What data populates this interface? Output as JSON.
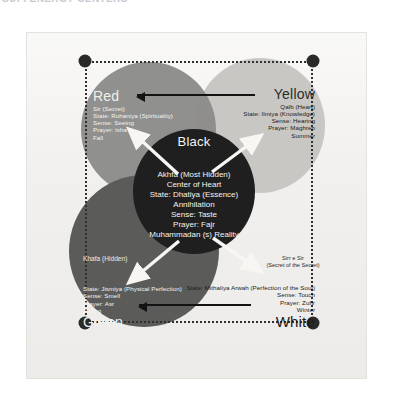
{
  "page": {
    "header_fragment": "SUFI ENERGY CENTERS",
    "background_color": "#ffffff",
    "scan_color": "#f2f1ef"
  },
  "diagram": {
    "type": "venn-overlapping-circles",
    "title_center": "Black",
    "colors": {
      "red_circle": "#8c8c8a",
      "yellow_circle": "#c8c7c3",
      "green_circle": "#5b5b5a",
      "black_circle": "#1f1f1f",
      "white_circle": "#f4f3f1",
      "arrow": "#131313",
      "dot": "#2a2a29"
    },
    "corner_dots": [
      {
        "name": "dot-top-left",
        "x": 58,
        "y": 28
      },
      {
        "name": "dot-top-right",
        "x": 286,
        "y": 28
      },
      {
        "name": "dot-bottom-left",
        "x": 58,
        "y": 290
      },
      {
        "name": "dot-bottom-right",
        "x": 286,
        "y": 290
      }
    ],
    "regions": [
      {
        "id": "red",
        "label": "Red",
        "lines": [
          "Sir (Secret)",
          "State: Ruhaniya (Spirituality)",
          "Sense: Seeing",
          "Prayer: Isha",
          "Fall"
        ]
      },
      {
        "id": "yellow",
        "label": "Yellow",
        "lines": [
          "Qalb (Heart)",
          "State: Ilmiya (Knowledge)",
          "Sense: Hearing",
          "Prayer: Maghreb",
          "Summer"
        ]
      },
      {
        "id": "black",
        "label": "Black",
        "lines": [
          "Akhfa (Most Hidden)",
          "Center of Heart",
          "State: Dhatiya (Essence)",
          "Annihilation",
          "Sense: Taste",
          "Prayer: Fajr",
          "Muhammadan (s) Reality"
        ]
      },
      {
        "id": "green",
        "label": "Green",
        "hidden_label": "Khafa (Hidden)",
        "lines": [
          "State: Jismiya (Physical Perfection)",
          "Sense: Smell",
          "Prayer: Asr",
          "Spring"
        ]
      },
      {
        "id": "white",
        "label": "White",
        "secret_label_line1": "Sirr e Sir",
        "secret_label_line2": "(Secret of the Secret)",
        "lines": [
          "State: Mithaliya Arwah (Perfection of the Soul)",
          "Sense: Touch",
          "Prayer: Zuhr",
          "Winter"
        ]
      }
    ],
    "arrows": [
      {
        "name": "arrow-yellow-to-red",
        "direction": "left",
        "position": "top"
      },
      {
        "name": "arrow-white-to-green",
        "direction": "left",
        "position": "bottom"
      },
      {
        "name": "arrow-black-to-red",
        "direction": "up-left",
        "style": "white"
      },
      {
        "name": "arrow-black-to-yellow",
        "direction": "up-right",
        "style": "white"
      },
      {
        "name": "arrow-black-to-green",
        "direction": "down-left",
        "style": "white"
      },
      {
        "name": "arrow-black-to-white",
        "direction": "down-right",
        "style": "white"
      }
    ]
  }
}
